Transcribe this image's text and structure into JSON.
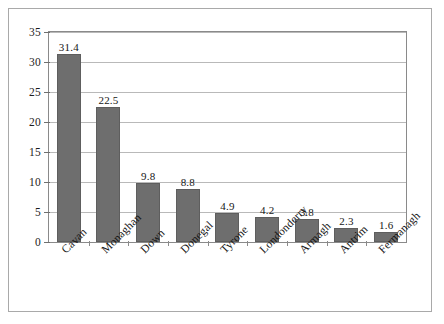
{
  "chart_data": {
    "type": "bar",
    "title": "",
    "subtitle": "",
    "xlabel": "",
    "ylabel": "",
    "categories": [
      "Cavan",
      "Monaghan",
      "Down",
      "Donegal",
      "Tyrone",
      "Londonderry",
      "Armagh",
      "Antrim",
      "Fermanagh"
    ],
    "values": [
      31.4,
      22.5,
      9.8,
      8.8,
      4.9,
      4.2,
      3.8,
      2.3,
      1.6
    ],
    "value_labels": [
      "31.4",
      "22.5",
      "9.8",
      "8.8",
      "4.9",
      "4.2",
      "3.8",
      "2.3",
      "1.6"
    ],
    "ylim": [
      0,
      35
    ],
    "yticks": [
      0,
      5,
      10,
      15,
      20,
      25,
      30,
      35
    ],
    "ytick_labels": [
      "0",
      "5",
      "10",
      "15",
      "20",
      "25",
      "30",
      "35"
    ],
    "grid": true,
    "legend": null,
    "legend_position": "none",
    "bar_color": "#6e6e6e",
    "bar_edge_color": "#5e5e5e",
    "gridline_color": "#b9b9b9",
    "axis_color": "#8a8a8a",
    "background_color": "#ffffff",
    "frame_color": "#a9a9a9",
    "xlabel_rotation": -45
  }
}
